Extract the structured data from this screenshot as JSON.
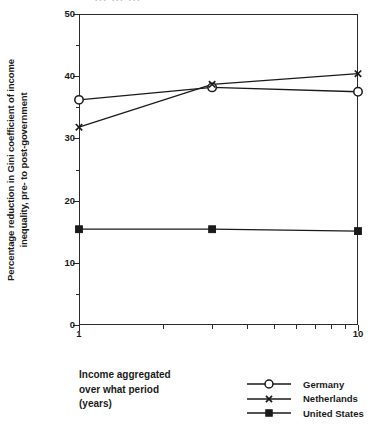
{
  "top_sliver": {
    "text": "... ... ..."
  },
  "chart_data": {
    "type": "line",
    "title": "",
    "subtitle": "",
    "xlabel": "Income aggregated over what period (years)",
    "xlabel_lines": [
      "Income aggregated",
      "over what period",
      "(years)"
    ],
    "ylabel": "Percentage reduction in Gini coefficient of income inequality, pre- to post-government",
    "ylabel_lines": [
      "Percentage reduction in Gini coefficient of income",
      "inequality, pre- to post-government"
    ],
    "xscale": "log",
    "xlim": [
      1,
      10
    ],
    "ylim": [
      0,
      50
    ],
    "ytick_labels": [
      "0",
      "10",
      "20",
      "30",
      "40",
      "50"
    ],
    "ytick_values": [
      0,
      10,
      20,
      30,
      40,
      50
    ],
    "ytick_minor_values": [
      5,
      15,
      25,
      35,
      45
    ],
    "xtick_labels": [
      "1",
      "10"
    ],
    "xtick_values": [
      1,
      10
    ],
    "xtick_minor_values": [
      2,
      3,
      4,
      5,
      6,
      7,
      8,
      9
    ],
    "grid": false,
    "legend_position": "below-right",
    "x": [
      1,
      3,
      10
    ],
    "series": [
      {
        "name": "Germany",
        "marker": "open-circle",
        "values": [
          36.2,
          38.2,
          37.5
        ]
      },
      {
        "name": "Netherlands",
        "marker": "cross",
        "values": [
          31.8,
          38.7,
          40.4
        ]
      },
      {
        "name": "United States",
        "marker": "filled-square",
        "values": [
          15.4,
          15.4,
          15.1
        ]
      }
    ],
    "colors": {
      "line": "#1a1a1a",
      "axis": "#2b2b2b",
      "background": "#ffffff"
    }
  },
  "legend": {
    "items": [
      {
        "label": "Germany"
      },
      {
        "label": "Netherlands"
      },
      {
        "label": "United States"
      }
    ]
  }
}
